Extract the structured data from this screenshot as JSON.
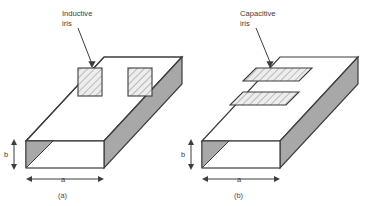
{
  "figure": {
    "background": "#ffffff",
    "stroke_color": "#3d3d3d",
    "face_gray": "#a8a8a8",
    "hatch_fill": "#e8e8e8",
    "text_color": "#3a3a3a"
  },
  "panels": [
    {
      "id": "a",
      "caption": "(a)",
      "iris_label_line1": "Inductive",
      "iris_label_line2": "iris",
      "iris_type": "inductive",
      "iris_description": "two vertical hatched plates on left and right walls leaving a central vertical gap",
      "dim_width": "a",
      "dim_height": "b"
    },
    {
      "id": "b",
      "caption": "(b)",
      "iris_label_line1": "Capacitive",
      "iris_label_line2": "iris",
      "iris_type": "capacitive",
      "iris_description": "two horizontal hatched plates on top and bottom walls leaving a central horizontal gap",
      "dim_width": "a",
      "dim_height": "b"
    }
  ]
}
